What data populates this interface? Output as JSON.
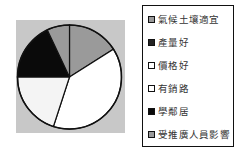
{
  "chart_data": {
    "type": "pie",
    "title": "",
    "categories": [
      "氣候土壤適宜",
      "產量好",
      "價格好",
      "有銷路",
      "學鄰居",
      "受推廣人員影響"
    ],
    "values": [
      16,
      0,
      39,
      20,
      18,
      7
    ],
    "unit": "%",
    "colors": [
      "#9a9a9a",
      "#222222",
      "#ffffff",
      "#f4f4f4",
      "#0a0a0a",
      "#9a9a9a"
    ],
    "start_angle_deg": 0,
    "direction": "clockwise",
    "plot_background": "#c8c8c8",
    "legend_position": "right",
    "grid": false
  },
  "legend": {
    "items": [
      {
        "label": "氣候土壤適宜",
        "color": "#9a9a9a"
      },
      {
        "label": "產量好",
        "color": "#222222"
      },
      {
        "label": "價格好",
        "color": "#ffffff"
      },
      {
        "label": "有銷路",
        "color": "#ffffff"
      },
      {
        "label": "學鄰居",
        "color": "#0a0a0a"
      },
      {
        "label": "受推廣人員影響",
        "color": "#9a9a9a"
      }
    ]
  }
}
